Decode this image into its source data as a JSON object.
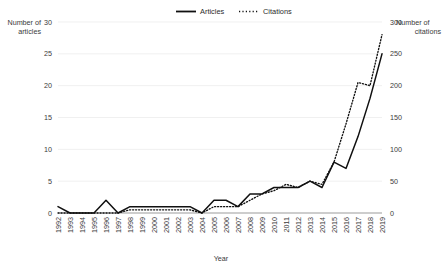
{
  "chart_data": {
    "type": "line",
    "title": "",
    "xlabel": "Year",
    "ylabel": "Number of articles",
    "y2label": "Number of citations",
    "grid": true,
    "legend_position": "top-center",
    "ylim": [
      0,
      30
    ],
    "y2lim": [
      0,
      300
    ],
    "yticks": [
      "0",
      "5",
      "10",
      "15",
      "20",
      "25",
      "30"
    ],
    "ytick_values": [
      0,
      5,
      10,
      15,
      20,
      25,
      30
    ],
    "y2ticks": [
      "0",
      "50",
      "100",
      "150",
      "200",
      "250",
      "300"
    ],
    "y2tick_values": [
      0,
      50,
      100,
      150,
      200,
      250,
      300
    ],
    "categories": [
      "1992",
      "1993",
      "1994",
      "1995",
      "1996",
      "1997",
      "1998",
      "1999",
      "2000",
      "2001",
      "2002",
      "2003",
      "2004",
      "2005",
      "2006",
      "2007",
      "2008",
      "2009",
      "2010",
      "2011",
      "2012",
      "2013",
      "2014",
      "2015",
      "2016",
      "2017",
      "2018",
      "2019"
    ],
    "series": [
      {
        "name": "Articles",
        "axis": "left",
        "style": "solid",
        "color": "#101010",
        "values": [
          1,
          0,
          0,
          0,
          2,
          0,
          1,
          1,
          1,
          1,
          1,
          1,
          0,
          2,
          2,
          1,
          3,
          3,
          4,
          4,
          4,
          5,
          4,
          8,
          7,
          12,
          18,
          25
        ]
      },
      {
        "name": "Citations",
        "axis": "right",
        "style": "dotted",
        "color": "#101010",
        "values": [
          0,
          0,
          0,
          0,
          0,
          0,
          5,
          5,
          5,
          5,
          5,
          5,
          0,
          10,
          10,
          10,
          20,
          30,
          35,
          45,
          40,
          50,
          45,
          80,
          140,
          205,
          200,
          280
        ]
      }
    ]
  },
  "labels": {
    "y_axis_title": "Number of articles",
    "y2_axis_title": "Number of citations",
    "x_axis_title": "Year"
  },
  "legend": {
    "items": [
      {
        "label": "Articles",
        "style": "solid"
      },
      {
        "label": "Citations",
        "style": "dotted"
      }
    ]
  }
}
